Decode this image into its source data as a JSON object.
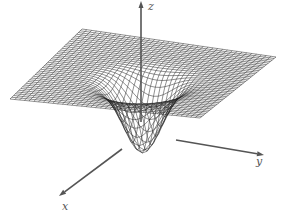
{
  "figure": {
    "type": "3d-wireframe-surface",
    "colors": {
      "mesh": "#222222",
      "axis": "#555555",
      "background": "#ffffff"
    }
  },
  "axes": {
    "x": {
      "label": "x",
      "label_pos": [
        62,
        200
      ],
      "from": [
        122,
        149
      ],
      "to": [
        59,
        196
      ]
    },
    "y": {
      "label": "y",
      "label_pos": [
        256,
        155
      ],
      "from": [
        176,
        140
      ],
      "to": [
        264,
        155
      ]
    },
    "z": {
      "label": "z",
      "label_pos": [
        148,
        0
      ],
      "from": [
        141,
        122
      ],
      "to": [
        141,
        1
      ]
    }
  },
  "surface": {
    "grid_lines": 40,
    "corners": {
      "back": [
        82,
        29
      ],
      "right": [
        276,
        57
      ],
      "left": [
        10,
        99
      ],
      "front": [
        200,
        118
      ]
    },
    "well_center": [
      145,
      120
    ],
    "well_depth": 68,
    "well_width": 0.16
  }
}
